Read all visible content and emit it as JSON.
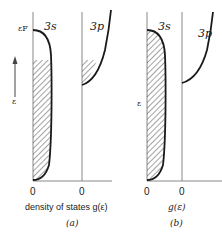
{
  "panel_a": {
    "band_3s_label": "3s",
    "band_3p_label": "3p",
    "fermi_label": "εF",
    "energy_axis_label": "ε",
    "zero_left": "0",
    "zero_right": "0",
    "xlabel": "density of states g(ε)",
    "caption": "(a)"
  },
  "panel_b": {
    "band_3s_label": "3s",
    "band_3p_label": "3p",
    "energy_axis_label": "ε",
    "zero_left": "0",
    "zero_right": "0",
    "xlabel": "g(ε)",
    "caption": "(b)"
  },
  "colors": {
    "line": "#1a1a1a",
    "axis": "#888888",
    "hatch": "#333333"
  }
}
